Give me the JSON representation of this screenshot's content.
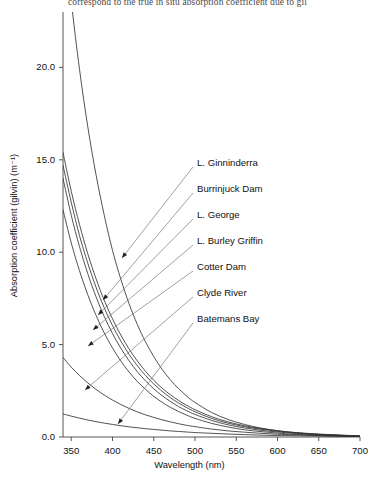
{
  "caption": "correspond to the true in situ absorption coefficient due to gil",
  "chart_data": {
    "type": "line",
    "title": "",
    "xlabel": "Wavelength (nm)",
    "ylabel": "Absorption coefficient (gilvin)  (m⁻¹)",
    "xlim": [
      340,
      700
    ],
    "ylim": [
      0.0,
      23.0
    ],
    "xticks": [
      350,
      400,
      450,
      500,
      550,
      600,
      650,
      700
    ],
    "yticks": [
      0.0,
      5.0,
      10.0,
      15.0,
      20.0
    ],
    "ytick_labels": [
      "0.0",
      "5.0",
      "10.0",
      "15.0",
      "20.0"
    ],
    "xtick_labels": [
      "350",
      "400",
      "450",
      "500",
      "550",
      "600",
      "650",
      "700"
    ],
    "grid": false,
    "legend": "inline-leader-labels",
    "x": [
      340,
      350,
      360,
      370,
      380,
      390,
      400,
      410,
      420,
      430,
      440,
      450,
      460,
      470,
      480,
      490,
      500,
      520,
      540,
      560,
      580,
      600,
      620,
      650,
      700
    ],
    "series": [
      {
        "name": "L. Ginninderra",
        "label_x": 197,
        "label_y": 163,
        "anchor_x": 122,
        "anchor_y": 258,
        "values": [
          28.0,
          23.6,
          19.9,
          16.8,
          14.2,
          12.0,
          10.1,
          8.55,
          7.22,
          6.1,
          5.15,
          4.35,
          3.67,
          3.1,
          2.62,
          2.21,
          1.87,
          1.33,
          0.95,
          0.68,
          0.48,
          0.34,
          0.24,
          0.14,
          0.05
        ]
      },
      {
        "name": "Burrinjuck Dam",
        "label_x": 197,
        "label_y": 189,
        "anchor_x": 103,
        "anchor_y": 300,
        "values": [
          15.4,
          13.3,
          11.5,
          9.92,
          8.57,
          7.4,
          6.39,
          5.52,
          4.77,
          4.12,
          3.56,
          3.07,
          2.65,
          2.29,
          1.98,
          1.71,
          1.48,
          1.1,
          0.82,
          0.61,
          0.46,
          0.34,
          0.25,
          0.16,
          0.06
        ]
      },
      {
        "name": "L. George",
        "label_x": 197,
        "label_y": 215,
        "anchor_x": 98,
        "anchor_y": 315,
        "values": [
          14.7,
          12.7,
          10.9,
          9.41,
          8.11,
          6.99,
          6.03,
          5.2,
          4.48,
          3.86,
          3.33,
          2.87,
          2.48,
          2.13,
          1.84,
          1.59,
          1.37,
          1.01,
          0.75,
          0.56,
          0.42,
          0.31,
          0.23,
          0.14,
          0.05
        ]
      },
      {
        "name": "L. Burley Griffin",
        "label_x": 197,
        "label_y": 241,
        "anchor_x": 93,
        "anchor_y": 330,
        "values": [
          14.0,
          12.0,
          10.3,
          8.84,
          7.59,
          6.52,
          5.6,
          4.81,
          4.13,
          3.54,
          3.04,
          2.61,
          2.24,
          1.93,
          1.65,
          1.42,
          1.22,
          0.9,
          0.66,
          0.49,
          0.36,
          0.27,
          0.2,
          0.12,
          0.04
        ]
      },
      {
        "name": "Cotter Dam",
        "label_x": 197,
        "label_y": 267,
        "anchor_x": 88,
        "anchor_y": 346,
        "values": [
          12.3,
          10.5,
          9.0,
          7.7,
          6.59,
          5.63,
          4.82,
          4.12,
          3.52,
          3.01,
          2.58,
          2.2,
          1.88,
          1.61,
          1.38,
          1.18,
          1.01,
          0.74,
          0.54,
          0.39,
          0.29,
          0.21,
          0.15,
          0.09,
          0.03
        ]
      },
      {
        "name": "Clyde River",
        "label_x": 197,
        "label_y": 293,
        "anchor_x": 85,
        "anchor_y": 390,
        "values": [
          4.3,
          3.78,
          3.33,
          2.93,
          2.58,
          2.27,
          2.0,
          1.76,
          1.55,
          1.36,
          1.2,
          1.06,
          0.93,
          0.82,
          0.72,
          0.63,
          0.56,
          0.43,
          0.33,
          0.26,
          0.2,
          0.15,
          0.12,
          0.08,
          0.03
        ]
      },
      {
        "name": "Batemans Bay",
        "label_x": 197,
        "label_y": 319,
        "anchor_x": 118,
        "anchor_y": 424,
        "values": [
          1.25,
          1.13,
          1.02,
          0.92,
          0.83,
          0.75,
          0.68,
          0.61,
          0.55,
          0.5,
          0.45,
          0.41,
          0.37,
          0.33,
          0.3,
          0.27,
          0.24,
          0.2,
          0.16,
          0.13,
          0.1,
          0.08,
          0.07,
          0.05,
          0.02
        ]
      }
    ]
  }
}
